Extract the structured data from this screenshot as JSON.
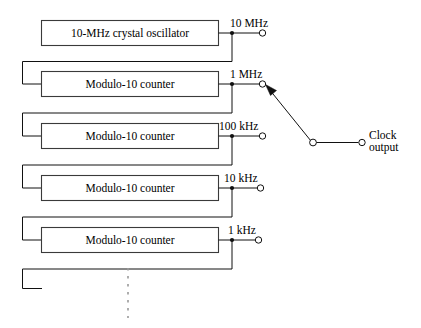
{
  "diagram": {
    "blocks": [
      {
        "label": "10-MHz crystal oscillator",
        "output_label": "10 MHz"
      },
      {
        "label": "Modulo-10 counter",
        "output_label": "1 MHz"
      },
      {
        "label": "Modulo-10 counter",
        "output_label": "100 kHz"
      },
      {
        "label": "Modulo-10 counter",
        "output_label": "10 kHz"
      },
      {
        "label": "Modulo-10 counter",
        "output_label": "1 kHz"
      }
    ],
    "output": {
      "line1": "Clock",
      "line2": "output"
    },
    "continuation_hint": "vertical dotted line indicating additional divider stages",
    "colors": {
      "wire": "#111111",
      "box_border": "#3a3a3a",
      "background": "#ffffff",
      "dashed": "#9a9a9a"
    }
  }
}
